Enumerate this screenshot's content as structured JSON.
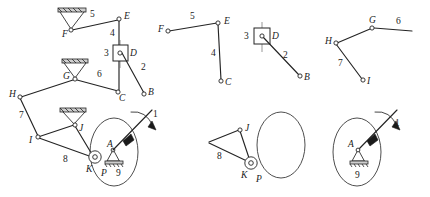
{
  "figure": {
    "background_color": "#ffffff",
    "line_color": "#242424",
    "width": 430,
    "height": 197
  },
  "panels": [
    {
      "id": "assembled-mechanism",
      "name": "Complete mechanism assembly",
      "joints": [
        {
          "label": "F",
          "x": 71,
          "y": 30,
          "type": "ground-pivot"
        },
        {
          "label": "E",
          "x": 119,
          "y": 19,
          "type": "pin"
        },
        {
          "label": "D",
          "x": 120,
          "y": 53,
          "type": "slider-pin"
        },
        {
          "label": "C",
          "x": 118,
          "y": 92,
          "type": "pin"
        },
        {
          "label": "B",
          "x": 144,
          "y": 94,
          "type": "pin"
        },
        {
          "label": "G",
          "x": 75,
          "y": 79,
          "type": "ground-pivot"
        },
        {
          "label": "H",
          "x": 20,
          "y": 97,
          "type": "pin"
        },
        {
          "label": "I",
          "x": 38,
          "y": 137,
          "type": "pin"
        },
        {
          "label": "J",
          "x": 75,
          "y": 125,
          "type": "ground-pivot"
        },
        {
          "label": "K",
          "x": 95,
          "y": 157,
          "type": "roller"
        },
        {
          "label": "P",
          "x": 100,
          "y": 163,
          "type": "contact-point"
        },
        {
          "label": "A",
          "x": 113,
          "y": 150,
          "type": "ground-pivot"
        }
      ],
      "link_numbers": [
        {
          "label": "5",
          "x": 90,
          "y": 17
        },
        {
          "label": "4",
          "x": 110,
          "y": 36
        },
        {
          "label": "3",
          "x": 107,
          "y": 54
        },
        {
          "label": "2",
          "x": 141,
          "y": 68
        },
        {
          "label": "1",
          "x": 155,
          "y": 116
        },
        {
          "label": "6",
          "x": 99,
          "y": 76
        },
        {
          "label": "7",
          "x": 22,
          "y": 117
        },
        {
          "label": "8",
          "x": 65,
          "y": 160
        },
        {
          "label": "9",
          "x": 118,
          "y": 174
        }
      ]
    },
    {
      "id": "dyad-efc",
      "name": "Dyad links 5 and 4 with joints F, E, C",
      "joints": [
        {
          "label": "F",
          "x": 168,
          "y": 31,
          "type": "pin"
        },
        {
          "label": "E",
          "x": 218,
          "y": 23,
          "type": "pin"
        },
        {
          "label": "C",
          "x": 221,
          "y": 81,
          "type": "pin"
        }
      ],
      "link_numbers": [
        {
          "label": "5",
          "x": 192,
          "y": 18
        },
        {
          "label": "4",
          "x": 212,
          "y": 54
        }
      ]
    },
    {
      "id": "slider-dyad-db",
      "name": "Slider block 3 with link 2 joints D and B",
      "joints": [
        {
          "label": "D",
          "x": 262,
          "y": 36,
          "type": "slider-pin"
        },
        {
          "label": "B",
          "x": 300,
          "y": 76,
          "type": "pin"
        }
      ],
      "link_numbers": [
        {
          "label": "3",
          "x": 247,
          "y": 38
        },
        {
          "label": "2",
          "x": 285,
          "y": 56
        }
      ]
    },
    {
      "id": "dyad-hgi",
      "name": "Dyad links 6 and 7 with joints H, G, I",
      "joints": [
        {
          "label": "H",
          "x": 336,
          "y": 43,
          "type": "pin"
        },
        {
          "label": "G",
          "x": 372,
          "y": 28,
          "type": "pin"
        },
        {
          "label": "I",
          "x": 363,
          "y": 80,
          "type": "pin"
        }
      ],
      "link_numbers": [
        {
          "label": "6",
          "x": 398,
          "y": 23
        },
        {
          "label": "7",
          "x": 340,
          "y": 64
        }
      ]
    },
    {
      "id": "dyad-jkp",
      "name": "Link 8 triangle with joints J, K and contact point P",
      "joints": [
        {
          "label": "J",
          "x": 240,
          "y": 130,
          "type": "pin"
        },
        {
          "label": "K",
          "x": 251,
          "y": 163,
          "type": "roller"
        },
        {
          "label": "P",
          "x": 258,
          "y": 170,
          "type": "contact-point"
        }
      ],
      "link_numbers": [
        {
          "label": "8",
          "x": 219,
          "y": 157
        }
      ]
    },
    {
      "id": "crank-a",
      "name": "Driving crank 1 on ground 9 about pivot A",
      "joints": [
        {
          "label": "A",
          "x": 358,
          "y": 150,
          "type": "ground-pivot"
        }
      ],
      "link_numbers": [
        {
          "label": "1",
          "x": 394,
          "y": 124
        },
        {
          "label": "9",
          "x": 362,
          "y": 177
        }
      ]
    }
  ],
  "annotations": {
    "rotation_arrows": [
      {
        "panel": "assembled-mechanism",
        "near_label": "1"
      },
      {
        "panel": "crank-a",
        "near_label": "1"
      }
    ],
    "cam_ellipses": [
      {
        "panel": "assembled-mechanism",
        "cx": 114,
        "cy": 152,
        "rx": 24,
        "ry": 34
      },
      {
        "panel": "dyad-jkp",
        "cx": 281,
        "cy": 145,
        "rx": 24,
        "ry": 33
      },
      {
        "panel": "crank-a",
        "cx": 357,
        "cy": 152,
        "rx": 24,
        "ry": 34
      }
    ]
  }
}
